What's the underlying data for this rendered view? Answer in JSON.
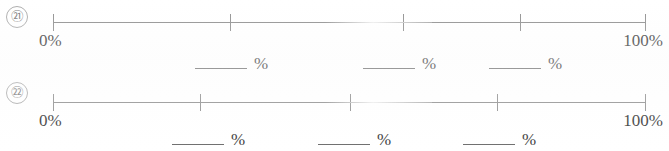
{
  "page": {
    "background_color": "#ffffff",
    "line_color": "#8f8f8f",
    "text_color": "#3a3a3a"
  },
  "exercises": [
    {
      "number_label": "㉑",
      "number_plain": "20",
      "scale": {
        "left_label": "0%",
        "right_label": "100%",
        "tick_positions_px": [
          53,
          230,
          403,
          520,
          645
        ]
      },
      "blanks": [
        {
          "unit": "%",
          "value": "",
          "left_px": 195
        },
        {
          "unit": "%",
          "value": "",
          "left_px": 363
        },
        {
          "unit": "%",
          "value": "",
          "left_px": 489
        }
      ]
    },
    {
      "number_label": "㉒",
      "number_plain": "21",
      "scale": {
        "left_label": "0%",
        "right_label": "100%",
        "tick_positions_px": [
          53,
          200,
          350,
          497,
          645
        ]
      },
      "blanks": [
        {
          "unit": "%",
          "value": "",
          "left_px": 172
        },
        {
          "unit": "%",
          "value": "",
          "left_px": 318
        },
        {
          "unit": "%",
          "value": "",
          "left_px": 463
        }
      ]
    }
  ]
}
